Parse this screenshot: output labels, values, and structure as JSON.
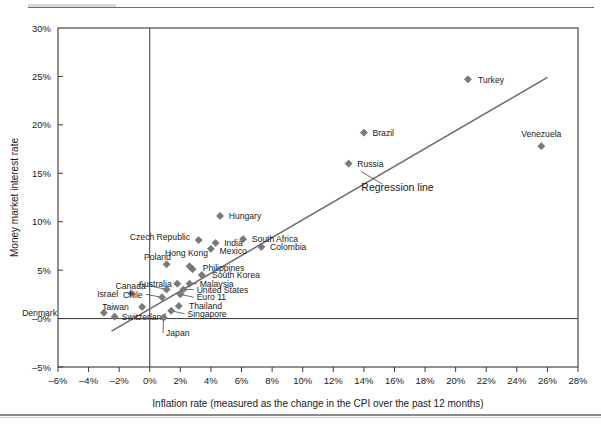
{
  "chart_data": {
    "type": "scatter",
    "title": "",
    "xlabel": "Inflation rate (measured as the change in the CPI over the past 12 months)",
    "ylabel": "Money market interest rate",
    "xlim": [
      -6,
      28
    ],
    "ylim": [
      -5,
      30
    ],
    "xticks": [
      "–6%",
      "–4%",
      "–2%",
      "0%",
      "2%",
      "4%",
      "6%",
      "8%",
      "10%",
      "12%",
      "14%",
      "16%",
      "18%",
      "20%",
      "22%",
      "24%",
      "26%",
      "28%"
    ],
    "xtick_values": [
      -6,
      -4,
      -2,
      0,
      2,
      4,
      6,
      8,
      10,
      12,
      14,
      16,
      18,
      20,
      22,
      24,
      26,
      28
    ],
    "yticks": [
      "–5%",
      "–0%",
      "5%",
      "10%",
      "15%",
      "20%",
      "25%",
      "30%"
    ],
    "ytick_values": [
      -5,
      0,
      5,
      10,
      15,
      20,
      25,
      30
    ],
    "grid": false,
    "legend": "none",
    "marker_shape": "diamond",
    "marker_color": "#7a7a7a",
    "line_color": "#6a6a6a",
    "points": [
      {
        "name": "Denmark",
        "x": -3.0,
        "y": 0.6,
        "lx": -6.0,
        "ly": 0.6,
        "anchor": "end",
        "leader": false
      },
      {
        "name": "Switzerland",
        "x": -2.3,
        "y": 0.2,
        "lx": -1.9,
        "ly": 0.2,
        "anchor": "start",
        "leader": false
      },
      {
        "name": "Israel",
        "x": -1.2,
        "y": 2.6,
        "lx": -2.0,
        "ly": 2.6,
        "anchor": "end",
        "leader": false
      },
      {
        "name": "Taiwan",
        "x": -0.5,
        "y": 1.2,
        "lx": -1.3,
        "ly": 1.2,
        "anchor": "end",
        "leader": false
      },
      {
        "name": "Chile",
        "x": 0.8,
        "y": 2.2,
        "lx": -0.4,
        "ly": 2.5,
        "anchor": "end",
        "leader": true
      },
      {
        "name": "Canada",
        "x": 1.1,
        "y": 3.0,
        "lx": -0.2,
        "ly": 3.4,
        "anchor": "end",
        "leader": true
      },
      {
        "name": "Japan",
        "x": 0.9,
        "y": 0.1,
        "lx": 1.0,
        "ly": -1.5,
        "anchor": "start",
        "leader": true
      },
      {
        "name": "Singapore",
        "x": 1.4,
        "y": 0.8,
        "lx": 2.4,
        "ly": 0.5,
        "anchor": "start",
        "leader": true
      },
      {
        "name": "Thailand",
        "x": 1.9,
        "y": 1.3,
        "lx": 2.5,
        "ly": 1.3,
        "anchor": "start",
        "leader": false
      },
      {
        "name": "Euro 11",
        "x": 2.0,
        "y": 2.5,
        "lx": 3.0,
        "ly": 2.2,
        "anchor": "start",
        "leader": true
      },
      {
        "name": "United States",
        "x": 2.2,
        "y": 3.0,
        "lx": 3.0,
        "ly": 3.0,
        "anchor": "start",
        "leader": true
      },
      {
        "name": "Australia",
        "x": 1.8,
        "y": 3.6,
        "lx": 1.5,
        "ly": 3.6,
        "anchor": "end",
        "leader": false
      },
      {
        "name": "Malaysia",
        "x": 2.6,
        "y": 3.6,
        "lx": 3.2,
        "ly": 3.6,
        "anchor": "start",
        "leader": true
      },
      {
        "name": "South Korea",
        "x": 3.4,
        "y": 4.5,
        "lx": 4.0,
        "ly": 4.5,
        "anchor": "start",
        "leader": false
      },
      {
        "name": "Philippines",
        "x": 2.8,
        "y": 5.1,
        "lx": 3.4,
        "ly": 5.2,
        "anchor": "start",
        "leader": false
      },
      {
        "name": "Hong Kong",
        "x": 2.6,
        "y": 5.4,
        "lx": 2.4,
        "ly": 6.8,
        "anchor": "middle",
        "leader": false
      },
      {
        "name": "Poland",
        "x": 1.1,
        "y": 5.6,
        "lx": 0.5,
        "ly": 6.4,
        "anchor": "middle",
        "leader": false
      },
      {
        "name": "Mexico",
        "x": 4.0,
        "y": 7.2,
        "lx": 4.5,
        "ly": 7.0,
        "anchor": "start",
        "leader": false
      },
      {
        "name": "India",
        "x": 4.3,
        "y": 7.8,
        "lx": 4.8,
        "ly": 7.8,
        "anchor": "start",
        "leader": false
      },
      {
        "name": "Czech Republic",
        "x": 3.2,
        "y": 8.1,
        "lx": 2.7,
        "ly": 8.4,
        "anchor": "end",
        "leader": false
      },
      {
        "name": "South Africa",
        "x": 6.1,
        "y": 8.2,
        "lx": 6.6,
        "ly": 8.2,
        "anchor": "start",
        "leader": false
      },
      {
        "name": "Colombia",
        "x": 7.3,
        "y": 7.4,
        "lx": 7.8,
        "ly": 7.4,
        "anchor": "start",
        "leader": false
      },
      {
        "name": "Hungary",
        "x": 4.6,
        "y": 10.6,
        "lx": 5.1,
        "ly": 10.6,
        "anchor": "start",
        "leader": false
      },
      {
        "name": "Russia",
        "x": 13.0,
        "y": 16.0,
        "lx": 13.5,
        "ly": 16.0,
        "anchor": "start",
        "leader": false
      },
      {
        "name": "Brazil",
        "x": 14.0,
        "y": 19.2,
        "lx": 14.5,
        "ly": 19.2,
        "anchor": "start",
        "leader": false
      },
      {
        "name": "Turkey",
        "x": 20.8,
        "y": 24.7,
        "lx": 21.4,
        "ly": 24.7,
        "anchor": "start",
        "leader": false
      },
      {
        "name": "Venezuela",
        "x": 25.6,
        "y": 17.8,
        "lx": 25.6,
        "ly": 19.1,
        "anchor": "middle",
        "leader": false
      }
    ],
    "regression_line": {
      "x0": -2.5,
      "y0": -1.3,
      "x1": 26.0,
      "y1": 24.9
    },
    "annotation": {
      "text": "Regression line",
      "x": 16.2,
      "y": 13.2,
      "leader_from": {
        "x": 13.8,
        "y": 15.2
      },
      "leader_to": {
        "x": 15.2,
        "y": 13.9
      }
    }
  }
}
